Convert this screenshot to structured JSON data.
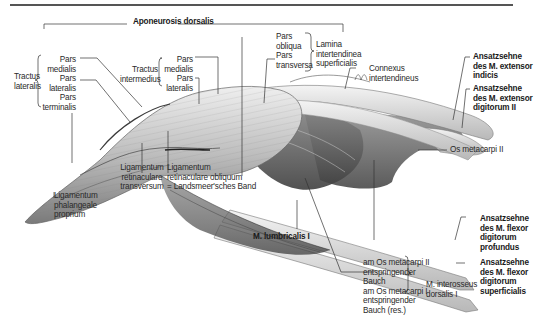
{
  "figure": {
    "title": "Aponeurosis dorsalis",
    "colors": {
      "background": "#ffffff",
      "leader_lines": "#333333",
      "tissue_light": "#e6e6e6",
      "tissue_mid": "#a9a9a9",
      "tissue_dark": "#4a4a4a"
    }
  },
  "labels": {
    "aponeurosis": "Aponeurosis dorsalis",
    "tractus_lateralis": {
      "group": [
        "Tractus",
        "lateralis"
      ],
      "parts": [
        "Pars",
        "medialis",
        "Pars",
        "lateralis",
        "Pars",
        "terminalis"
      ]
    },
    "tractus_intermedius": {
      "group": [
        "Tractus",
        "intermedius"
      ],
      "parts": [
        "Pars",
        "medialis",
        "Pars",
        "lateralis"
      ]
    },
    "lamina": {
      "group": [
        "Lamina",
        "intertendinea",
        "superficialis"
      ],
      "parts": [
        "Pars",
        "obliqua",
        "Pars",
        "transversa"
      ]
    },
    "connexus": [
      "Connexus",
      "intertendineus"
    ],
    "ext_indicis": [
      "Ansatzsehne",
      "des M. extensor",
      "indicis"
    ],
    "ext_digitorum": [
      "Ansatzsehne",
      "des M. extensor",
      "digitorum II"
    ],
    "os_metacarpi": "Os metacarpi II",
    "flex_profundus": [
      "Ansatzsehne",
      "des M. flexor",
      "digitorum",
      "profundus"
    ],
    "flex_superficialis": [
      "Ansatzsehne",
      "des M. flexor",
      "digitorum",
      "superficialis"
    ],
    "interosseus": {
      "group": [
        "M. interosseus",
        "dorsalis I"
      ],
      "parts": [
        "am Os metacarpi II",
        "entspringender",
        "Bauch",
        "am Os metacarpi I",
        "entspringender",
        "Bauch (res.)"
      ]
    },
    "lumbricalis": "M. lumbricalis I",
    "lig_obliquum": [
      "Ligamentum",
      "retinaculare obliquum",
      "= Landsmeer'sches Band"
    ],
    "lig_transversum": [
      "Ligamentum",
      "retinaculare",
      "transversum"
    ],
    "lig_phalangeale": [
      "Ligamentum",
      "phalangeale",
      "proprium"
    ]
  }
}
